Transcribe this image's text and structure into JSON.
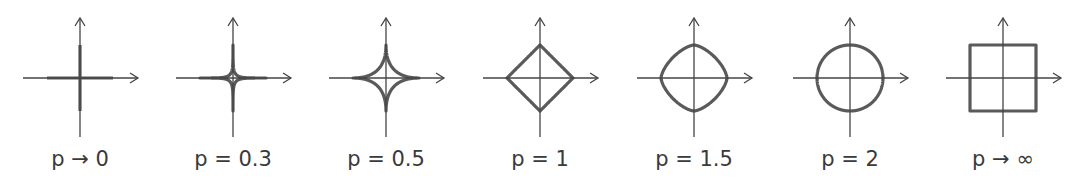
{
  "figure": {
    "colors": {
      "shape": "#5a5a5a",
      "axis": "#444444",
      "text": "#3a3a3a",
      "background": "#ffffff"
    },
    "geometry": {
      "axis_y": 78,
      "radius": 33,
      "axis_left": 57,
      "axis_right": 58,
      "axis_top": 60,
      "axis_bottom": 59
    },
    "panels": [
      {
        "label": "p → 0",
        "p": 0,
        "center_x": 80
      },
      {
        "label": "p = 0.3",
        "p": 0.3,
        "center_x": 233
      },
      {
        "label": "p = 0.5",
        "p": 0.5,
        "center_x": 386
      },
      {
        "label": "p = 1",
        "p": 1,
        "center_x": 540
      },
      {
        "label": "p = 1.5",
        "p": 1.5,
        "center_x": 694
      },
      {
        "label": "p = 2",
        "p": 2,
        "center_x": 850
      },
      {
        "label": "p → ∞",
        "p": "inf",
        "center_x": 1003
      }
    ]
  }
}
